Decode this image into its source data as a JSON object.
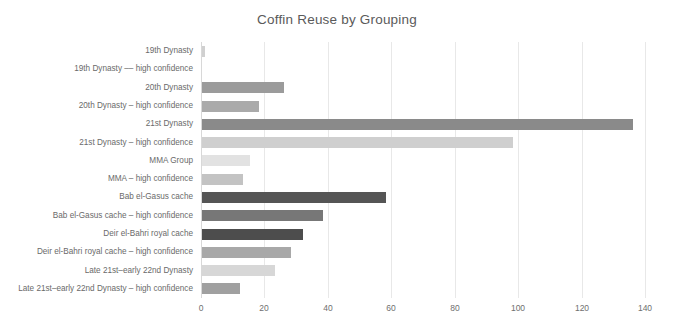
{
  "chart_data": {
    "type": "bar",
    "orientation": "horizontal",
    "title": "Coffin Reuse by Grouping",
    "xlabel": "",
    "ylabel": "",
    "xlim": [
      0,
      140
    ],
    "xticks": [
      0,
      20,
      40,
      60,
      80,
      100,
      120,
      140
    ],
    "grid": "vertical",
    "legend": "none",
    "categories": [
      "19th Dynasty",
      "19th Dynasty –– high confidence",
      "20th Dynasty",
      "20th Dynasty – high confidence",
      "21st Dynasty",
      "21st Dynasty – high confidence",
      "MMA Group",
      "MMA – high confidence",
      "Bab el-Gasus cache",
      "Bab el-Gasus cache – high confidence",
      "Deir el-Bahri royal cache",
      "Deir el-Bahri royal cache – high confidence",
      "Late 21st–early 22nd Dynasty",
      "Late 21st–early 22nd Dynasty – high confidence"
    ],
    "values": [
      1,
      0,
      26,
      18,
      136,
      98,
      15,
      13,
      58,
      38,
      32,
      28,
      23,
      12
    ],
    "bar_colors": [
      "#d0d0d0",
      "#d8d8d8",
      "#9b9b9b",
      "#aaaaaa",
      "#8a8a8a",
      "#cfcfcf",
      "#e2e2e2",
      "#c3c3c3",
      "#555555",
      "#777777",
      "#4d4d4d",
      "#a8a8a8",
      "#d7d7d7",
      "#a0a0a0"
    ]
  },
  "colors": {
    "background": "#ffffff",
    "gridline": "#e8e8e8",
    "axis": "#d8d8d8",
    "title_text": "#5a5a5a",
    "label_text": "#6a6a6a",
    "tick_text": "#6f6f6f"
  }
}
